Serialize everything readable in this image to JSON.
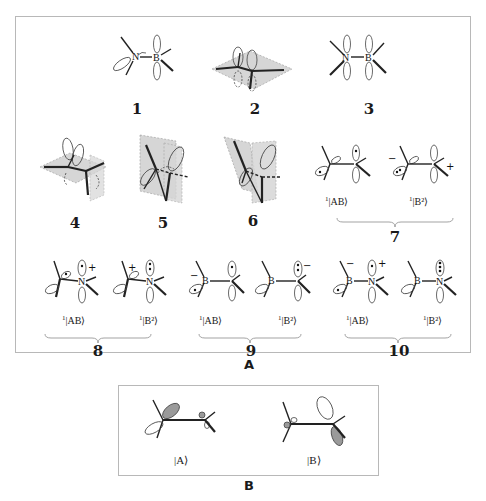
{
  "panel_a": {
    "label": "A",
    "structures": [
      {
        "id": "1",
        "label": "1",
        "atoms": [
          "N",
          "B"
        ]
      },
      {
        "id": "2",
        "label": "2"
      },
      {
        "id": "3",
        "label": "3",
        "atoms": [
          "N",
          "B"
        ]
      },
      {
        "id": "4",
        "label": "4"
      },
      {
        "id": "5",
        "label": "5"
      },
      {
        "id": "6",
        "label": "6"
      },
      {
        "id": "7",
        "label": "7",
        "states": [
          {
            "prefix": "1",
            "ket": "|AB⟩",
            "charges": []
          },
          {
            "prefix": "1",
            "ket": "|B²⟩",
            "charges": [
              "−",
              "+"
            ]
          }
        ]
      },
      {
        "id": "8",
        "label": "8",
        "atoms": [
          "N"
        ],
        "states": [
          {
            "prefix": "1",
            "ket": "|AB⟩",
            "charges": [
              "+"
            ]
          },
          {
            "prefix": "1",
            "ket": "|B²⟩",
            "charges": [
              "+"
            ]
          }
        ]
      },
      {
        "id": "9",
        "label": "9",
        "atoms": [
          "B"
        ],
        "states": [
          {
            "prefix": "1",
            "ket": "|AB⟩",
            "charges": [
              "−"
            ]
          },
          {
            "prefix": "1",
            "ket": "|B²⟩",
            "charges": [
              "−"
            ]
          }
        ]
      },
      {
        "id": "10",
        "label": "10",
        "atoms": [
          "B",
          "N"
        ],
        "states": [
          {
            "prefix": "1",
            "ket": "|AB⟩",
            "charges": [
              "−",
              "+"
            ]
          },
          {
            "prefix": "1",
            "ket": "|B²⟩",
            "charges": []
          }
        ]
      }
    ]
  },
  "panel_b": {
    "label": "B",
    "states": [
      {
        "ket": "|A⟩"
      },
      {
        "ket": "|B⟩"
      }
    ]
  },
  "colors": {
    "border": "#b8b8b8",
    "plane_fill": "#d6d6d6",
    "orbital_shade": "#9a9a9a",
    "ink": "#1a1a1a"
  }
}
